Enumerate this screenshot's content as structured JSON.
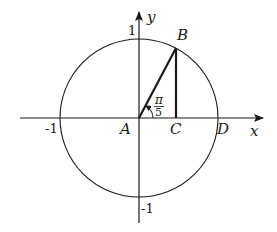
{
  "diagram": {
    "type": "unit-circle",
    "axes": {
      "x_label": "x",
      "y_label": "y"
    },
    "ticks": {
      "x_neg": "-1",
      "y_pos": "1",
      "y_neg": "-1"
    },
    "points": {
      "A": "A",
      "B": "B",
      "C": "C",
      "D": "D"
    },
    "angle": {
      "numerator": "π",
      "denominator": "5"
    },
    "colors": {
      "stroke": "#1a1a1a",
      "background": "#ffffff"
    }
  }
}
